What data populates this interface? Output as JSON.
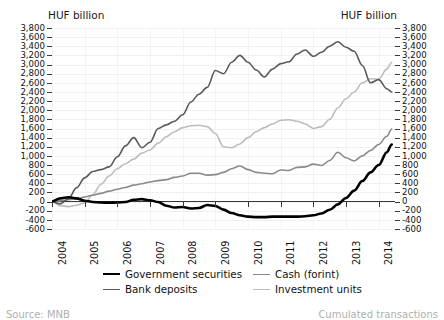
{
  "axis_unit_left": "HUF billion",
  "axis_unit_right": "HUF billion",
  "footer": {
    "left": "Source: MNB",
    "right": "Cumulated transactions"
  },
  "legend": {
    "items": [
      {
        "label": "Government securities",
        "color": "#000000",
        "width": 2.6
      },
      {
        "label": "Bank deposits",
        "color": "#5a5a5a",
        "width": 1.6
      },
      {
        "label": "Cash (forint)",
        "color": "#8a8a8a",
        "width": 1.6
      },
      {
        "label": "Investment units",
        "color": "#bdbdbd",
        "width": 1.6
      }
    ]
  },
  "chart_data": {
    "type": "line",
    "title": "",
    "subtitle": "",
    "xlabel": "",
    "ylabel": "HUF billion",
    "ylim": [
      -600,
      3800
    ],
    "ytick_step": 200,
    "yticks": [
      3800,
      3600,
      3400,
      3200,
      3000,
      2800,
      2600,
      2400,
      2200,
      2000,
      1800,
      1600,
      1400,
      1200,
      1000,
      800,
      600,
      400,
      200,
      0,
      -200,
      -400,
      -600
    ],
    "ytick_labels": [
      "3,800",
      "3,600",
      "3,400",
      "3,200",
      "3,000",
      "2,800",
      "2,600",
      "2,400",
      "2,200",
      "2,000",
      "1,800",
      "1,600",
      "1,400",
      "1,200",
      "1,000",
      "800",
      "600",
      "400",
      "200",
      "0",
      "-200",
      "-400",
      "-600"
    ],
    "xlim": [
      2004.0,
      2014.5
    ],
    "xticks": [
      2004,
      2005,
      2006,
      2007,
      2008,
      2009,
      2010,
      2011,
      2012,
      2013,
      2014
    ],
    "xtick_labels": [
      "2004",
      "2005",
      "2006",
      "2007",
      "2008",
      "2009",
      "2010",
      "2011",
      "2012",
      "2013",
      "2014"
    ],
    "grid": "horizontal-faint",
    "legend_position": "below",
    "zero_line": true,
    "series": [
      {
        "name": "Government securities",
        "color": "#000000",
        "x": [
          2004.0,
          2004.25,
          2004.5,
          2004.75,
          2005.0,
          2005.25,
          2005.5,
          2005.75,
          2006.0,
          2006.25,
          2006.5,
          2006.75,
          2007.0,
          2007.25,
          2007.5,
          2007.75,
          2008.0,
          2008.25,
          2008.5,
          2008.75,
          2009.0,
          2009.25,
          2009.5,
          2009.75,
          2010.0,
          2010.25,
          2010.5,
          2010.75,
          2011.0,
          2011.25,
          2011.5,
          2011.75,
          2012.0,
          2012.25,
          2012.5,
          2012.75,
          2013.0,
          2013.25,
          2013.5,
          2013.75,
          2014.0,
          2014.25,
          2014.4
        ],
        "values": [
          0,
          70,
          95,
          70,
          20,
          -10,
          -20,
          -25,
          -20,
          -10,
          40,
          55,
          30,
          -10,
          -90,
          -130,
          -120,
          -150,
          -140,
          -75,
          -95,
          -175,
          -250,
          -300,
          -330,
          -340,
          -340,
          -330,
          -330,
          -330,
          -330,
          -320,
          -300,
          -260,
          -180,
          -60,
          80,
          240,
          450,
          640,
          800,
          1080,
          1250
        ]
      },
      {
        "name": "Bank deposits",
        "color": "#5a5a5a",
        "x": [
          2004.0,
          2004.25,
          2004.5,
          2004.75,
          2005.0,
          2005.25,
          2005.5,
          2005.75,
          2006.0,
          2006.25,
          2006.5,
          2006.75,
          2007.0,
          2007.25,
          2007.5,
          2007.75,
          2008.0,
          2008.25,
          2008.5,
          2008.75,
          2009.0,
          2009.25,
          2009.5,
          2009.75,
          2010.0,
          2010.25,
          2010.5,
          2010.75,
          2011.0,
          2011.25,
          2011.5,
          2011.75,
          2012.0,
          2012.25,
          2012.5,
          2012.75,
          2013.0,
          2013.25,
          2013.5,
          2013.75,
          2014.0,
          2014.25,
          2014.4
        ],
        "values": [
          0,
          -50,
          60,
          300,
          520,
          660,
          700,
          760,
          980,
          1220,
          1400,
          1180,
          1300,
          1600,
          1680,
          1760,
          1900,
          2180,
          2350,
          2500,
          2870,
          2800,
          3050,
          3200,
          3050,
          2880,
          2730,
          2900,
          3020,
          3060,
          3230,
          3320,
          3180,
          3270,
          3400,
          3500,
          3380,
          3290,
          2980,
          2600,
          2670,
          2470,
          2400
        ]
      },
      {
        "name": "Cash (forint)",
        "color": "#8a8a8a",
        "x": [
          2004.0,
          2004.25,
          2004.5,
          2004.75,
          2005.0,
          2005.25,
          2005.5,
          2005.75,
          2006.0,
          2006.25,
          2006.5,
          2006.75,
          2007.0,
          2007.25,
          2007.5,
          2007.75,
          2008.0,
          2008.25,
          2008.5,
          2008.75,
          2009.0,
          2009.25,
          2009.5,
          2009.75,
          2010.0,
          2010.25,
          2010.5,
          2010.75,
          2011.0,
          2011.25,
          2011.5,
          2011.75,
          2012.0,
          2012.25,
          2012.5,
          2012.75,
          2013.0,
          2013.25,
          2013.5,
          2013.75,
          2014.0,
          2014.25,
          2014.4
        ],
        "values": [
          0,
          20,
          40,
          60,
          100,
          140,
          180,
          230,
          270,
          310,
          360,
          390,
          430,
          460,
          480,
          530,
          560,
          620,
          620,
          580,
          590,
          640,
          720,
          780,
          700,
          640,
          620,
          610,
          690,
          680,
          750,
          760,
          820,
          790,
          900,
          1080,
          960,
          890,
          1000,
          1120,
          1250,
          1430,
          1590
        ]
      },
      {
        "name": "Investment units",
        "color": "#bdbdbd",
        "x": [
          2004.0,
          2004.25,
          2004.5,
          2004.75,
          2005.0,
          2005.25,
          2005.5,
          2005.75,
          2006.0,
          2006.25,
          2006.5,
          2006.75,
          2007.0,
          2007.25,
          2007.5,
          2007.75,
          2008.0,
          2008.25,
          2008.5,
          2008.75,
          2009.0,
          2009.25,
          2009.5,
          2009.75,
          2010.0,
          2010.25,
          2010.5,
          2010.75,
          2011.0,
          2011.25,
          2011.5,
          2011.75,
          2012.0,
          2012.25,
          2012.5,
          2012.75,
          2013.0,
          2013.25,
          2013.5,
          2013.75,
          2014.0,
          2014.25,
          2014.4
        ],
        "values": [
          0,
          -90,
          -110,
          -80,
          -30,
          150,
          380,
          560,
          720,
          830,
          930,
          1060,
          1130,
          1280,
          1420,
          1530,
          1620,
          1660,
          1670,
          1640,
          1490,
          1200,
          1180,
          1260,
          1400,
          1530,
          1620,
          1700,
          1780,
          1790,
          1760,
          1700,
          1600,
          1640,
          1800,
          2050,
          2250,
          2400,
          2600,
          2690,
          2680,
          2900,
          3050
        ]
      }
    ]
  }
}
